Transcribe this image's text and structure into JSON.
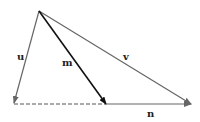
{
  "diagram": {
    "type": "vector-triangle",
    "colors": {
      "gray_line": "#666666",
      "dark_line": "#111111",
      "dashed_line": "#555555",
      "label": "#222222",
      "background": "#ffffff"
    },
    "points": {
      "origin": [
        39,
        11
      ],
      "u_tip": [
        14,
        103
      ],
      "m_tip": [
        106,
        104
      ],
      "v_tip": [
        191,
        104
      ]
    },
    "vectors": [
      {
        "name": "u",
        "label": "u",
        "from": [
          39,
          11
        ],
        "to": [
          14,
          103
        ],
        "style": "gray"
      },
      {
        "name": "m",
        "label": "m",
        "from": [
          39,
          11
        ],
        "to": [
          106,
          104
        ],
        "style": "dark"
      },
      {
        "name": "v",
        "label": "v",
        "from": [
          39,
          11
        ],
        "to": [
          191,
          104
        ],
        "style": "gray"
      },
      {
        "name": "n",
        "label": "n",
        "from": [
          106,
          104
        ],
        "to": [
          191,
          104
        ],
        "style": "gray"
      }
    ],
    "dashed_segment": {
      "from": [
        14,
        104
      ],
      "to": [
        106,
        104
      ]
    },
    "labels": {
      "u": "u",
      "m": "m",
      "v": "v",
      "n": "n"
    }
  }
}
